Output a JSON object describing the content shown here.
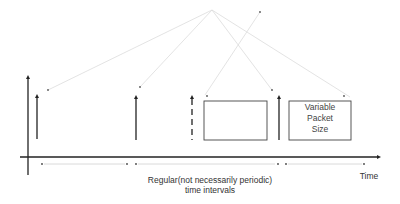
{
  "diagram": {
    "type": "packet-timing-diagram",
    "axis": {
      "x_label": "Time",
      "color": "#222222"
    },
    "interval_label": {
      "line1": "Regular(not necessarily periodic)",
      "line2": "time intervals"
    },
    "packet_box_label": {
      "line1": "Variable",
      "line2": "Packet",
      "line3": "Size"
    },
    "elements": {
      "impulses": [
        {
          "x": 37,
          "style": "solid"
        },
        {
          "x": 136,
          "style": "solid"
        },
        {
          "x": 192,
          "style": "dashed"
        },
        {
          "x": 279,
          "style": "solid"
        }
      ],
      "boxes": [
        {
          "x": 204,
          "y": 101,
          "w": 63,
          "h": 39,
          "label": false
        },
        {
          "x": 289,
          "y": 101,
          "w": 62,
          "h": 39,
          "label": true
        }
      ]
    },
    "colors": {
      "ink": "#222222",
      "guide": "#d8d8d8",
      "text": "#333333"
    }
  }
}
